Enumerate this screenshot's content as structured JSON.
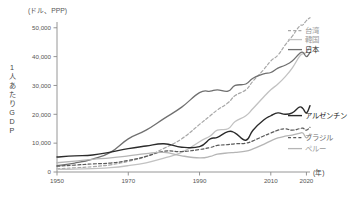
{
  "chart_data": {
    "type": "line",
    "title": "",
    "unit_note": "(ドル、PPP)",
    "ylabel": "1人あたりGDP",
    "xlabel": "(年)",
    "xlim": [
      1950,
      2021
    ],
    "ylim": [
      0,
      52000
    ],
    "grid": false,
    "legend_position": "right-inline",
    "yticks": [
      0,
      10000,
      20000,
      30000,
      40000,
      50000
    ],
    "ytick_labels": [
      "0",
      "10,000",
      "20,000",
      "30,000",
      "40,000",
      "50,000"
    ],
    "xticks": [
      1950,
      1970,
      1990,
      2010,
      2020
    ],
    "xtick_labels": [
      "1950",
      "1970",
      "1990",
      "2010",
      "2020"
    ],
    "x": [
      1950,
      1955,
      1960,
      1965,
      1970,
      1975,
      1980,
      1985,
      1990,
      1993,
      1995,
      1998,
      2000,
      2003,
      2005,
      2008,
      2010,
      2012,
      2014,
      2016,
      2018,
      2019,
      2020,
      2021
    ],
    "series": [
      {
        "name": "台湾",
        "label": "台湾",
        "style": "dashed",
        "color": "#a8a8a8",
        "width": 1.2,
        "values": [
          1100,
          1450,
          1850,
          2500,
          3700,
          5400,
          8200,
          11500,
          16500,
          19500,
          21500,
          24000,
          26500,
          28500,
          31500,
          35500,
          38500,
          40500,
          44000,
          47000,
          50500,
          51000,
          52500,
          53500
        ]
      },
      {
        "name": "韓国",
        "label": "韓国",
        "style": "solid",
        "color": "#c2c2c2",
        "width": 1.3,
        "values": [
          900,
          1000,
          1200,
          1500,
          2200,
          3200,
          4800,
          6800,
          10500,
          12500,
          14500,
          15000,
          17500,
          19500,
          22000,
          26000,
          28500,
          30500,
          33000,
          36000,
          40000,
          41000,
          41500,
          43500
        ]
      },
      {
        "name": "日本",
        "label": "日本",
        "style": "solid",
        "color": "#707070",
        "width": 1.3,
        "values": [
          2200,
          3100,
          4500,
          6800,
          11500,
          14500,
          18500,
          22500,
          27500,
          28000,
          28500,
          28000,
          30000,
          30500,
          32500,
          34000,
          34500,
          36000,
          37000,
          38500,
          41000,
          41500,
          40000,
          41500
        ]
      },
      {
        "name": "アルゼンチン",
        "label": "アルゼンチン",
        "style": "solid",
        "color": "#2b2b2b",
        "width": 1.4,
        "values": [
          5200,
          5600,
          5900,
          6900,
          8100,
          9000,
          9800,
          8600,
          8800,
          11500,
          12000,
          14000,
          13500,
          11000,
          14500,
          18000,
          19500,
          20500,
          20000,
          20500,
          22500,
          22000,
          20500,
          23000
        ]
      },
      {
        "name": "ブラジル",
        "label": "ブラジル",
        "style": "dashed",
        "color": "#5a5a5a",
        "width": 1.2,
        "values": [
          2000,
          2400,
          2800,
          3100,
          4000,
          5400,
          7200,
          7100,
          7800,
          8500,
          9200,
          9500,
          9800,
          10000,
          10800,
          12500,
          13500,
          14500,
          15000,
          14500,
          15000,
          15200,
          14500,
          15500
        ]
      },
      {
        "name": "ペルー",
        "label": "ペルー",
        "style": "solid",
        "color": "#b5b5b5",
        "width": 1.3,
        "values": [
          3200,
          3800,
          4400,
          4900,
          5600,
          6400,
          6800,
          5600,
          4900,
          5400,
          6200,
          6600,
          6800,
          7200,
          8000,
          9600,
          10800,
          11800,
          12400,
          12800,
          13400,
          13500,
          11800,
          13200
        ]
      }
    ]
  }
}
